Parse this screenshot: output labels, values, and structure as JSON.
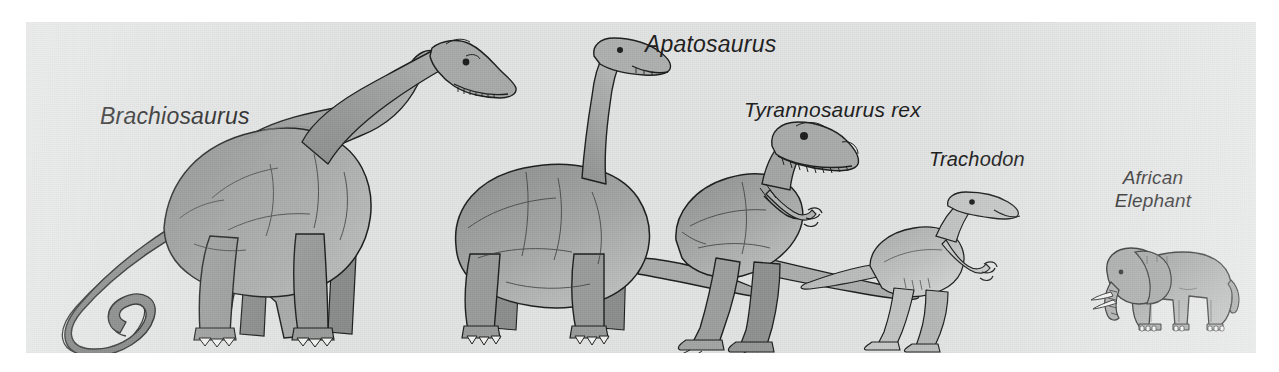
{
  "figure": {
    "kind": "size-comparison-illustration",
    "panel_background_color": "#e2e3e3",
    "page_background_color": "#ffffff",
    "ink_color": "#1d1d1d",
    "body_fill_dark": "#8d8e8e",
    "body_fill_mid": "#9b9c9c",
    "body_fill_light": "#c3c4c4",
    "claw_color": "#f4f4f2"
  },
  "labels": [
    {
      "id": "brachiosaurus",
      "text": "Brachiosaurus",
      "x": 100,
      "y": 103,
      "size": 23,
      "lines": [
        "Brachiosaurus"
      ]
    },
    {
      "id": "apatosaurus",
      "text": "Apatosaurus",
      "x": 645,
      "y": 31,
      "size": 23,
      "lines": [
        "Apatosaurus"
      ]
    },
    {
      "id": "tyrannosaurus-rex",
      "text": "Tyrannosaurus rex",
      "x": 744,
      "y": 98,
      "size": 21,
      "lines": [
        "Tyrannosaurus rex"
      ]
    },
    {
      "id": "trachodon",
      "text": "Trachodon",
      "x": 929,
      "y": 148,
      "size": 20,
      "lines": [
        "Trachodon"
      ]
    },
    {
      "id": "african-elephant",
      "text": "African Elephant",
      "x": 1098,
      "y": 166,
      "size": 19,
      "lines": [
        "African",
        "Elephant"
      ]
    }
  ],
  "creatures": [
    {
      "id": "brachiosaurus",
      "common_name": "Brachiosaurus",
      "order": 1,
      "relative_size_rank": "largest"
    },
    {
      "id": "apatosaurus",
      "common_name": "Apatosaurus",
      "order": 2,
      "relative_size_rank": "second"
    },
    {
      "id": "tyrannosaurus-rex",
      "common_name": "Tyrannosaurus rex",
      "order": 3,
      "relative_size_rank": "third"
    },
    {
      "id": "trachodon",
      "common_name": "Trachodon",
      "order": 4,
      "relative_size_rank": "fourth"
    },
    {
      "id": "african-elephant",
      "common_name": "African Elephant",
      "order": 5,
      "relative_size_rank": "smallest"
    }
  ]
}
